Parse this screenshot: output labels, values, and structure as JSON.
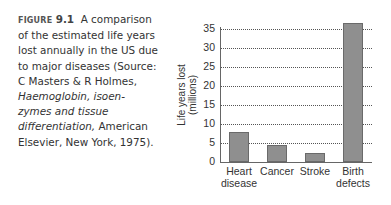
{
  "caption": {
    "figure_label": "FIGURE",
    "figure_number": "9.1",
    "text_regular": "A comparison of the estimated life years lost annually in the US due to major diseases (Source: C Masters & R Holmes,",
    "text_italic": "Haemoglobin, isoen-zymes and tissue differentiation,",
    "text_end": "American Elsevier, New York, 1975)."
  },
  "chart_data": {
    "type": "bar",
    "title": "",
    "xlabel": "",
    "ylabel": "Life years lost (millions)",
    "ylabel_line1": "Life years lost",
    "ylabel_line2": "(millions)",
    "categories": [
      "Heart disease",
      "Cancer",
      "Stroke",
      "Birth defects"
    ],
    "category_lines": [
      [
        "Heart",
        "disease"
      ],
      [
        "Cancer",
        ""
      ],
      [
        "Stroke",
        ""
      ],
      [
        "Birth",
        "defects"
      ]
    ],
    "values": [
      7.8,
      4.5,
      2.5,
      36.5
    ],
    "ylim": [
      0,
      35
    ],
    "yticks": [
      0,
      5,
      10,
      15,
      20,
      25,
      30,
      35
    ],
    "grid": "horizontal dotted",
    "bar_color": "#8f8f8f"
  }
}
